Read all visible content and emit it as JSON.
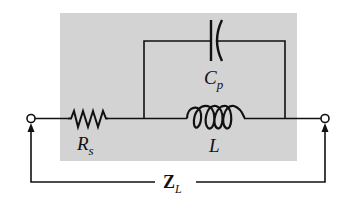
{
  "diagram": {
    "type": "circuit-schematic",
    "colors": {
      "background": "#ffffff",
      "shaded_region": "#d3d3d3",
      "wire": "#111111"
    },
    "components": [
      {
        "id": "Rs",
        "type": "resistor",
        "label": "R",
        "subscript": "s"
      },
      {
        "id": "L",
        "type": "inductor",
        "label": "L",
        "subscript": ""
      },
      {
        "id": "Cp",
        "type": "capacitor",
        "label": "C",
        "subscript": "p"
      }
    ],
    "terminals": [
      {
        "id": "left-terminal",
        "type": "open-circle"
      },
      {
        "id": "right-terminal",
        "type": "open-circle"
      }
    ],
    "impedance_label": {
      "main": "Z",
      "subscript": "L"
    },
    "connections": [
      "left-terminal -> Rs",
      "Rs -> node-A",
      "node-A -> L -> node-B",
      "node-A -> Cp -> node-B",
      "node-B -> right-terminal"
    ]
  }
}
